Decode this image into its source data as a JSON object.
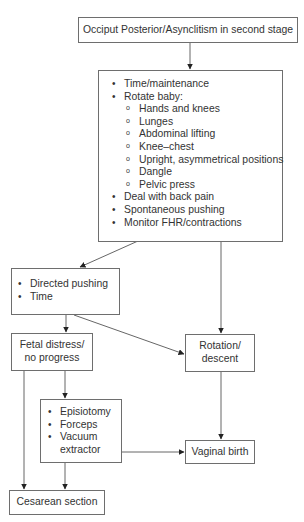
{
  "diagram": {
    "start": {
      "label": "Occiput Posterior/Asynclitism in second stage"
    },
    "management": {
      "items": [
        {
          "label": "Time/maintenance"
        },
        {
          "label": "Rotate baby:"
        }
      ],
      "sub_items": [
        {
          "label": "Hands and knees"
        },
        {
          "label": "Lunges"
        },
        {
          "label": "Abdominal lifting"
        },
        {
          "label": "Knee–chest"
        },
        {
          "label": "Upright, asymmetrical positions"
        },
        {
          "label": "Dangle"
        },
        {
          "label": "Pelvic press"
        }
      ],
      "items_after": [
        {
          "label": "Deal with back pain"
        },
        {
          "label": "Spontaneous pushing"
        },
        {
          "label": "Monitor FHR/contractions"
        }
      ]
    },
    "directed": {
      "items": [
        {
          "label": "Directed pushing"
        },
        {
          "label": "Time"
        }
      ]
    },
    "fetal_distress": {
      "line1": "Fetal distress/",
      "line2": "no progress"
    },
    "rotation": {
      "line1": "Rotation/",
      "line2": "descent"
    },
    "interventions": {
      "items": [
        {
          "label": "Episiotomy"
        },
        {
          "label": "Forceps"
        },
        {
          "label": "Vacuum"
        }
      ],
      "continuation": "extractor"
    },
    "vaginal_birth": {
      "label": "Vaginal birth"
    },
    "cesarean": {
      "label": "Cesarean section"
    },
    "colors": {
      "stroke": "#555555",
      "border": "#6e6e6e",
      "text": "#333333"
    }
  }
}
